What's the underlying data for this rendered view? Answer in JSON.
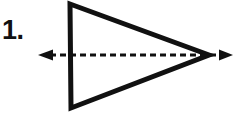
{
  "figure": {
    "label": "1.",
    "background_color": "#ffffff",
    "ink_color": "#111111",
    "elements": {
      "triangle": {
        "name": "triangle-shape",
        "stroke_color": "#111111",
        "stroke_width": 5,
        "fill": "none",
        "vertices": [
          {
            "label": "top-left",
            "x": 70,
            "y": 4
          },
          {
            "label": "apex-right",
            "x": 209,
            "y": 55
          },
          {
            "label": "bottom-left",
            "x": 71,
            "y": 108
          }
        ]
      },
      "axis_arrow": {
        "name": "axis-of-symmetry-arrow",
        "stroke_color": "#111111",
        "stroke_width": 3,
        "dash_pattern": "6 4",
        "y": 55,
        "x_start": 44,
        "x_end": 228,
        "arrowheads": [
          "left",
          "right"
        ],
        "arrowhead_size": 9
      }
    }
  },
  "chart_data": {
    "type": "diagram",
    "title": "1.",
    "shapes": [
      {
        "kind": "polygon",
        "name": "isosceles-triangle",
        "points": [
          [
            70,
            4
          ],
          [
            209,
            55
          ],
          [
            71,
            108
          ]
        ],
        "closed": true,
        "stroke": "#111111",
        "stroke_width": 5,
        "fill": "none"
      },
      {
        "kind": "line",
        "name": "dashed-double-arrow",
        "from": [
          44,
          55
        ],
        "to": [
          228,
          55
        ],
        "stroke": "#111111",
        "stroke_width": 3,
        "dashed": true,
        "arrow_start": true,
        "arrow_end": true
      }
    ],
    "annotations": [
      {
        "text": "1.",
        "x": 4,
        "y": 30,
        "bold": true
      }
    ]
  }
}
